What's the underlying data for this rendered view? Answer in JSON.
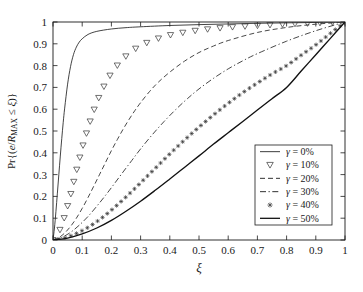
{
  "chart_data": {
    "type": "line",
    "title": "",
    "xlabel": "ξ",
    "ylabel": "Pr{(e/R_MAX ≤ ξ)}",
    "ylabel_parts": {
      "prefix": "Pr{(",
      "numerator": "e",
      "slash": "/",
      "denom_base": "R",
      "denom_sub": "MAX",
      "relation": " ≤ ",
      "variable": "ξ",
      "suffix": ")}"
    },
    "xlim": [
      0,
      1
    ],
    "ylim": [
      0,
      1
    ],
    "xticks": [
      0,
      0.1,
      0.2,
      0.3,
      0.4,
      0.5,
      0.6,
      0.7,
      0.8,
      0.9,
      1
    ],
    "yticks": [
      0,
      0.1,
      0.2,
      0.3,
      0.4,
      0.5,
      0.6,
      0.7,
      0.8,
      0.9,
      1
    ],
    "xticklabels": [
      "0",
      "0.1",
      "0.2",
      "0.3",
      "0.4",
      "0.5",
      "0.6",
      "0.7",
      "0.8",
      "0.9",
      "1"
    ],
    "yticklabels": [
      "0",
      "0.1",
      "0.2",
      "0.3",
      "0.4",
      "0.5",
      "0.6",
      "0.7",
      "0.8",
      "0.9",
      "1"
    ],
    "grid": false,
    "ticks_direction": "in",
    "frame": "box",
    "legend_position": "lower right",
    "legend_title": "",
    "series": [
      {
        "name": "γ = 0%",
        "gamma_percent": 0,
        "style": "solid-thin",
        "marker": "none",
        "color": "#222222",
        "x": [
          0,
          0.005,
          0.01,
          0.015,
          0.02,
          0.025,
          0.03,
          0.035,
          0.04,
          0.05,
          0.06,
          0.07,
          0.08,
          0.09,
          0.1,
          0.12,
          0.15,
          0.2,
          0.25,
          0.3,
          0.4,
          0.5,
          0.6,
          0.7,
          0.8,
          0.9,
          1
        ],
        "y": [
          0,
          0.055,
          0.13,
          0.215,
          0.3,
          0.385,
          0.465,
          0.54,
          0.605,
          0.715,
          0.795,
          0.85,
          0.885,
          0.908,
          0.923,
          0.943,
          0.957,
          0.968,
          0.974,
          0.978,
          0.984,
          0.988,
          0.991,
          0.994,
          0.996,
          0.998,
          1
        ]
      },
      {
        "name": "γ = 10%",
        "gamma_percent": 10,
        "style": "marker-only",
        "marker": "triangle-down",
        "color": "#333333",
        "x": [
          0,
          0.01,
          0.02,
          0.03,
          0.04,
          0.05,
          0.06,
          0.07,
          0.08,
          0.09,
          0.1,
          0.11,
          0.12,
          0.13,
          0.14,
          0.15,
          0.16,
          0.17,
          0.18,
          0.19,
          0.2,
          0.22,
          0.24,
          0.26,
          0.28,
          0.3,
          0.34,
          0.38,
          0.42,
          0.5,
          0.6,
          0.7,
          0.8,
          0.9,
          1
        ],
        "y": [
          0,
          0.012,
          0.035,
          0.068,
          0.108,
          0.155,
          0.205,
          0.26,
          0.315,
          0.368,
          0.42,
          0.468,
          0.513,
          0.555,
          0.594,
          0.63,
          0.662,
          0.692,
          0.718,
          0.742,
          0.764,
          0.8,
          0.83,
          0.855,
          0.875,
          0.891,
          0.915,
          0.932,
          0.945,
          0.962,
          0.975,
          0.983,
          0.99,
          0.995,
          1
        ]
      },
      {
        "name": "γ = 20%",
        "gamma_percent": 20,
        "style": "dashed",
        "marker": "none",
        "color": "#333333",
        "x": [
          0,
          0.02,
          0.04,
          0.06,
          0.08,
          0.1,
          0.12,
          0.14,
          0.16,
          0.18,
          0.2,
          0.22,
          0.24,
          0.26,
          0.28,
          0.3,
          0.33,
          0.36,
          0.4,
          0.45,
          0.5,
          0.55,
          0.6,
          0.7,
          0.8,
          0.9,
          1
        ],
        "y": [
          0,
          0.011,
          0.032,
          0.062,
          0.1,
          0.145,
          0.195,
          0.248,
          0.302,
          0.356,
          0.41,
          0.46,
          0.508,
          0.552,
          0.593,
          0.63,
          0.68,
          0.723,
          0.77,
          0.82,
          0.86,
          0.89,
          0.915,
          0.952,
          0.975,
          0.99,
          1
        ]
      },
      {
        "name": "γ = 30%",
        "gamma_percent": 30,
        "style": "dash-dot",
        "marker": "none",
        "color": "#333333",
        "x": [
          0,
          0.03,
          0.06,
          0.09,
          0.12,
          0.15,
          0.18,
          0.21,
          0.24,
          0.27,
          0.3,
          0.34,
          0.38,
          0.42,
          0.46,
          0.5,
          0.55,
          0.6,
          0.65,
          0.7,
          0.8,
          0.9,
          1
        ],
        "y": [
          0,
          0.012,
          0.035,
          0.068,
          0.108,
          0.155,
          0.205,
          0.258,
          0.312,
          0.365,
          0.418,
          0.483,
          0.543,
          0.598,
          0.648,
          0.693,
          0.742,
          0.785,
          0.822,
          0.855,
          0.912,
          0.96,
          1
        ]
      },
      {
        "name": "γ = 40%",
        "gamma_percent": 40,
        "style": "dotted-marker",
        "marker": "plus",
        "color": "#333333",
        "x": [
          0,
          0.04,
          0.08,
          0.12,
          0.16,
          0.2,
          0.24,
          0.28,
          0.32,
          0.36,
          0.4,
          0.45,
          0.5,
          0.55,
          0.6,
          0.65,
          0.7,
          0.75,
          0.8,
          0.85,
          0.9,
          0.95,
          1
        ],
        "y": [
          0,
          0.01,
          0.03,
          0.058,
          0.094,
          0.137,
          0.185,
          0.236,
          0.289,
          0.342,
          0.395,
          0.458,
          0.518,
          0.574,
          0.627,
          0.676,
          0.72,
          0.762,
          0.8,
          0.848,
          0.895,
          0.948,
          1
        ]
      },
      {
        "name": "γ = 50%",
        "gamma_percent": 50,
        "style": "solid-thick",
        "marker": "none",
        "color": "#111111",
        "x": [
          0,
          0.05,
          0.1,
          0.15,
          0.2,
          0.25,
          0.3,
          0.35,
          0.4,
          0.45,
          0.5,
          0.55,
          0.6,
          0.65,
          0.7,
          0.75,
          0.8,
          0.85,
          0.9,
          0.95,
          1
        ],
        "y": [
          0,
          0.009,
          0.028,
          0.055,
          0.09,
          0.132,
          0.178,
          0.228,
          0.28,
          0.333,
          0.386,
          0.44,
          0.492,
          0.544,
          0.596,
          0.648,
          0.7,
          0.775,
          0.85,
          0.925,
          1
        ]
      }
    ],
    "legend_entries": [
      {
        "label": "γ = 0%",
        "style": "solid-thin",
        "marker": "none"
      },
      {
        "label": "γ = 10%",
        "style": "marker-only",
        "marker": "triangle-down"
      },
      {
        "label": "γ = 20%",
        "style": "dashed",
        "marker": "none"
      },
      {
        "label": "γ = 30%",
        "style": "dash-dot",
        "marker": "none"
      },
      {
        "label": "γ = 40%",
        "style": "marker-plus",
        "marker": "plus"
      },
      {
        "label": "γ = 50%",
        "style": "solid-thick",
        "marker": "none"
      }
    ]
  }
}
